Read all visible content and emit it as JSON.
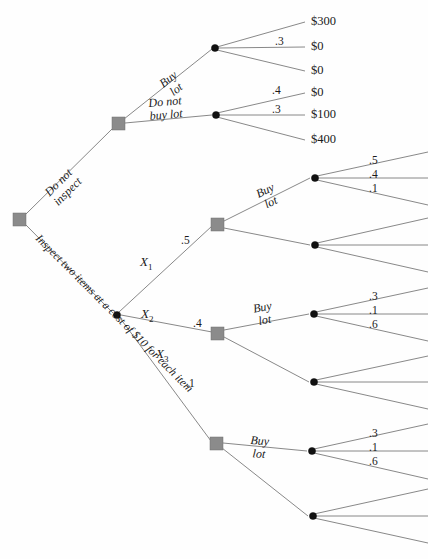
{
  "diagram": {
    "type": "decision-tree",
    "colors": {
      "branch": "#7b7b7b",
      "decision_node": "#8b8b8b",
      "chance_node": "#111111",
      "background": "#fefefe",
      "text": "#1a1a1a"
    }
  },
  "root": {
    "node_type": "decision",
    "branch_do_not_inspect": {
      "line1": "Do not",
      "line2": "inspect"
    },
    "branch_inspect": {
      "line1": "Inspect two items",
      "line2": "at a cost of $10",
      "line3": "for each item"
    }
  },
  "do_not_inspect": {
    "node_type": "decision",
    "buy_lot": {
      "line1": "Buy",
      "line2": "lot"
    },
    "do_not_buy_lot": {
      "line1": "Do not",
      "line2": "buy lot"
    },
    "buy_lot_chance": {
      "node_type": "chance",
      "probabilities": [
        "",
        ".3",
        ""
      ],
      "payoffs": [
        "$300",
        "$0",
        "$0"
      ]
    },
    "do_not_buy_chance": {
      "node_type": "chance",
      "probabilities": [
        ".4",
        ".3",
        ""
      ],
      "payoffs": [
        "$0",
        "$100",
        "$400"
      ]
    }
  },
  "inspect": {
    "node_type": "chance",
    "outcomes": [
      {
        "name": "X",
        "sub": "1",
        "probability": ".5",
        "decision": {
          "node_type": "decision",
          "buy_lot": {
            "line1": "Buy",
            "line2": "lot"
          },
          "buy_lot_chance": {
            "node_type": "chance",
            "probabilities": [
              ".5",
              ".4",
              ".1"
            ]
          },
          "do_not_buy_chance": {
            "node_type": "chance",
            "probabilities": [
              "",
              "",
              ""
            ]
          }
        }
      },
      {
        "name": "X",
        "sub": "2",
        "probability": ".4",
        "decision": {
          "node_type": "decision",
          "buy_lot": {
            "line1": "Buy",
            "line2": "lot"
          },
          "buy_lot_chance": {
            "node_type": "chance",
            "probabilities": [
              ".3",
              ".1",
              ".6"
            ]
          },
          "do_not_buy_chance": {
            "node_type": "chance",
            "probabilities": [
              "",
              "",
              ""
            ]
          }
        }
      },
      {
        "name": "X",
        "sub": "3",
        "probability": ".1",
        "decision": {
          "node_type": "decision",
          "buy_lot": {
            "line1": "Buy",
            "line2": "lot"
          },
          "buy_lot_chance": {
            "node_type": "chance",
            "probabilities": [
              ".3",
              ".1",
              ".6"
            ]
          },
          "do_not_buy_chance": {
            "node_type": "chance",
            "probabilities": [
              "",
              "",
              ""
            ]
          }
        }
      }
    ]
  }
}
